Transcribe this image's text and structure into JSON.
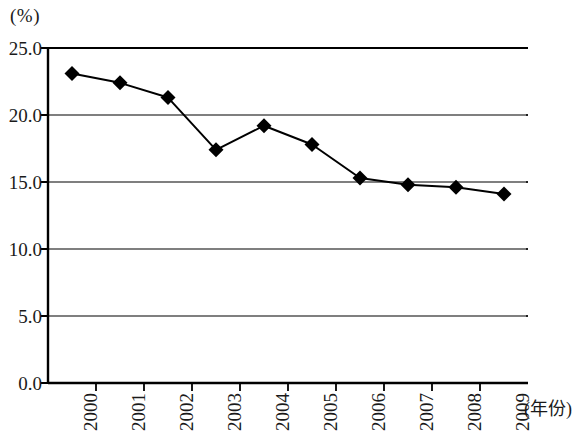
{
  "chart_data": {
    "type": "line",
    "title": "",
    "subtitle": "",
    "xlabel": "(年份)",
    "ylabel": "(%)",
    "categories": [
      "2000",
      "2001",
      "2002",
      "2003",
      "2004",
      "2005",
      "2006",
      "2007",
      "2008",
      "2009"
    ],
    "values": [
      23.1,
      22.4,
      21.3,
      17.4,
      19.2,
      17.8,
      15.3,
      14.8,
      14.6,
      14.1
    ],
    "series": [
      {
        "name": "",
        "values": [
          23.1,
          22.4,
          21.3,
          17.4,
          19.2,
          17.8,
          15.3,
          14.8,
          14.6,
          14.1
        ]
      }
    ],
    "ylim": [
      0.0,
      25.0
    ],
    "y_ticks": [
      "0.0",
      "5.0",
      "10.0",
      "15.0",
      "20.0",
      "25.0"
    ],
    "y_tick_values": [
      0.0,
      5.0,
      10.0,
      15.0,
      20.0,
      25.0
    ],
    "grid": true,
    "grid_axis": "y",
    "legend": "none",
    "marker": "diamond",
    "line_color": "#000000",
    "marker_color": "#000000",
    "grid_color": "#555555",
    "axis_color": "#000000",
    "background": "#ffffff"
  },
  "axes": {
    "y_unit": "(%)",
    "x_unit": "(年份)"
  }
}
